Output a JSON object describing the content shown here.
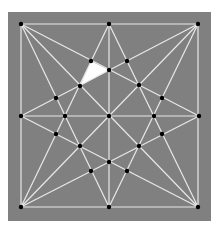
{
  "diagram": {
    "colors": {
      "page_background": "#ffffff",
      "panel_background": "#808080",
      "edge": "#e8e8e8",
      "node": "#000000",
      "highlight_fill": "#ffffff"
    },
    "panel": {
      "x": 8,
      "y": 12,
      "width": 203,
      "height": 209
    },
    "nodes": [
      {
        "id": "TL",
        "x": 21,
        "y": 24
      },
      {
        "id": "TM",
        "x": 109,
        "y": 24
      },
      {
        "id": "TR",
        "x": 198,
        "y": 24
      },
      {
        "id": "LM",
        "x": 21,
        "y": 116
      },
      {
        "id": "C",
        "x": 109,
        "y": 116
      },
      {
        "id": "RM",
        "x": 199,
        "y": 116
      },
      {
        "id": "BL",
        "x": 21,
        "y": 207
      },
      {
        "id": "BM",
        "x": 109,
        "y": 207
      },
      {
        "id": "BR",
        "x": 198,
        "y": 207
      },
      {
        "id": "A",
        "x": 91,
        "y": 61
      },
      {
        "id": "F",
        "x": 127,
        "y": 61
      },
      {
        "id": "P",
        "x": 109,
        "y": 70
      },
      {
        "id": "B",
        "x": 80,
        "y": 86
      },
      {
        "id": "G",
        "x": 139,
        "y": 85
      },
      {
        "id": "D",
        "x": 56,
        "y": 98
      },
      {
        "id": "H",
        "x": 162,
        "y": 98
      },
      {
        "id": "E",
        "x": 65,
        "y": 116
      },
      {
        "id": "I",
        "x": 154,
        "y": 116
      },
      {
        "id": "D2",
        "x": 56,
        "y": 134
      },
      {
        "id": "H2",
        "x": 162,
        "y": 134
      },
      {
        "id": "J",
        "x": 80,
        "y": 146
      },
      {
        "id": "K",
        "x": 139,
        "y": 146
      },
      {
        "id": "Q",
        "x": 109,
        "y": 162
      },
      {
        "id": "L",
        "x": 91,
        "y": 171
      },
      {
        "id": "M",
        "x": 127,
        "y": 171
      }
    ],
    "lines": [
      {
        "id": "border-top",
        "from": "TL",
        "to": "TR"
      },
      {
        "id": "border-right",
        "from": "TR",
        "to": "BR"
      },
      {
        "id": "border-bottom",
        "from": "BL",
        "to": "BR"
      },
      {
        "id": "border-left",
        "from": "TL",
        "to": "BL"
      },
      {
        "id": "axis-vertical",
        "from": "TM",
        "to": "BM"
      },
      {
        "id": "axis-horizontal",
        "from": "LM",
        "to": "RM"
      },
      {
        "id": "diagonal-main",
        "from": "TL",
        "to": "BR"
      },
      {
        "id": "diagonal-anti",
        "from": "TR",
        "to": "BL"
      },
      {
        "id": "tl-to-rm",
        "from": "TL",
        "to": "RM"
      },
      {
        "id": "tl-to-bm",
        "from": "TL",
        "to": "BM"
      },
      {
        "id": "tr-to-lm",
        "from": "TR",
        "to": "LM"
      },
      {
        "id": "tr-to-bm",
        "from": "TR",
        "to": "BM"
      },
      {
        "id": "bl-to-tm",
        "from": "BL",
        "to": "TM"
      },
      {
        "id": "bl-to-rm",
        "from": "BL",
        "to": "RM"
      },
      {
        "id": "br-to-tm",
        "from": "BR",
        "to": "TM"
      },
      {
        "id": "br-to-lm",
        "from": "BR",
        "to": "LM"
      }
    ],
    "highlighted_triangle": {
      "vertices": [
        "A",
        "P",
        "B"
      ]
    }
  }
}
